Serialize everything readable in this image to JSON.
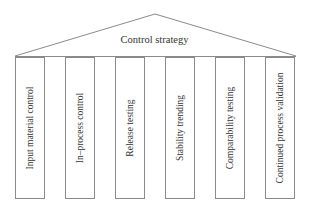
{
  "roof": {
    "label": "Control strategy"
  },
  "pillars": [
    {
      "label": "Input material control"
    },
    {
      "label": "In–process control"
    },
    {
      "label": "Release testing"
    },
    {
      "label": "Stability trending"
    },
    {
      "label": "Comparability testing"
    },
    {
      "label": "Continued process validation"
    }
  ],
  "colors": {
    "line": "#8a8a8a",
    "text": "#333333",
    "background": "#ffffff"
  }
}
